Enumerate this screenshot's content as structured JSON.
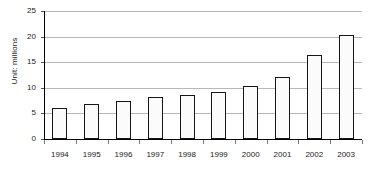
{
  "chart_data": {
    "type": "bar",
    "title": "",
    "subtitle": "",
    "xlabel": "",
    "ylabel": "Unit: millions",
    "categories": [
      "1994",
      "1995",
      "1996",
      "1997",
      "1998",
      "1999",
      "2000",
      "2001",
      "2002",
      "2003"
    ],
    "values": [
      6.1,
      6.9,
      7.5,
      8.2,
      8.5,
      9.2,
      10.4,
      12.1,
      16.5,
      20.3
    ],
    "series": [
      {
        "name": "",
        "values": [
          6.1,
          6.9,
          7.5,
          8.2,
          8.5,
          9.2,
          10.4,
          12.1,
          16.5,
          20.3
        ]
      }
    ],
    "ylim": [
      0,
      25
    ],
    "yticks": [
      0,
      5,
      10,
      15,
      20,
      25
    ],
    "ytick_labels": [
      "0",
      "5",
      "10",
      "15",
      "20",
      "25"
    ],
    "grid": true,
    "grid_axis": "y",
    "legend": false,
    "legend_position": "none",
    "bar_fill_color": "#fbfbfb",
    "bar_border_color": "#161616",
    "gridline_color": "#b8b8b8",
    "axis_color": "#000000",
    "text_color": "#1a1a1a",
    "background_color": "#ffffff"
  }
}
